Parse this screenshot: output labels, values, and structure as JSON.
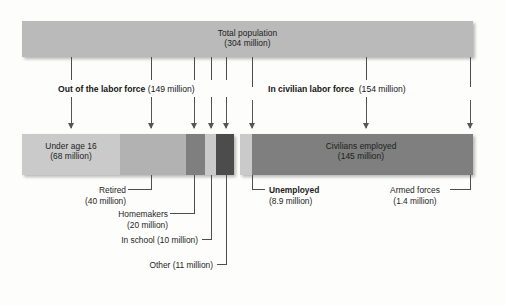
{
  "figure": {
    "type": "flow-breakdown-diagram",
    "top": {
      "title": "Total population",
      "value": "(304 million)"
    },
    "groups": [
      {
        "name_bold": "Out of the labor force",
        "value": "(149 million)"
      },
      {
        "name_bold": "In civilian labor force",
        "value": "(154 million)"
      }
    ],
    "segments": [
      {
        "key": "under-age-16",
        "label": "Under age 16",
        "value": "(68 million)",
        "in_bar": true,
        "bold": false,
        "color": "#c9cac9"
      },
      {
        "key": "retired",
        "label": "Retired",
        "value": "(40 million)",
        "in_bar": false,
        "bold": false,
        "color": "#b1b2b1"
      },
      {
        "key": "homemakers",
        "label": "Homemakers",
        "value": "(20 million)",
        "in_bar": false,
        "bold": false,
        "color": "#7e7f7e"
      },
      {
        "key": "in-school",
        "label": "In school",
        "value": "(10 million)",
        "in_bar": false,
        "bold": false,
        "color": "#c9cac9"
      },
      {
        "key": "other",
        "label": "Other",
        "value": "(11 million)",
        "in_bar": false,
        "bold": false,
        "color": "#4b4c4b"
      },
      {
        "key": "unemployed",
        "label": "Unemployed",
        "value": "(8.9 million)",
        "in_bar": false,
        "bold": true,
        "color": "#c9cac9"
      },
      {
        "key": "civilians-employed",
        "label": "Civilians employed",
        "value": "(145 million)",
        "in_bar": true,
        "bold": false,
        "color": "#7e7f7e"
      },
      {
        "key": "armed-forces",
        "label": "Armed forces",
        "value": "(1.4 million)",
        "in_bar": false,
        "bold": false,
        "color": "#7e7f7e"
      }
    ],
    "callouts": {
      "in_school_inline": "In school (10 million)",
      "other_inline": "Other (11 million)"
    },
    "colors": {
      "top_bar": "#b9bab9",
      "light_gray": "#c9cac9",
      "mid_gray": "#b1b2b1",
      "dark_gray": "#7e7f7e",
      "darkest_gray": "#4b4c4b",
      "line": "#4d4d4d",
      "text": "#1d1d1d"
    }
  }
}
